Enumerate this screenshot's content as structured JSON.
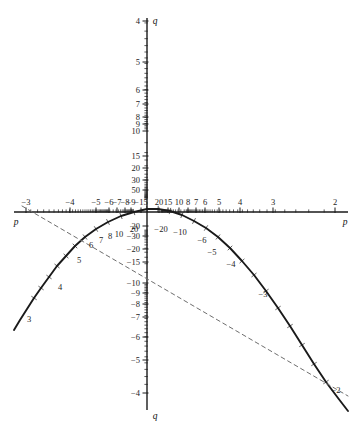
{
  "figure": {
    "background": "#ffffff",
    "axis_color": "#1a1a1a",
    "curve_color": "#1a1a1a",
    "dashed_color": "#6e6e6e"
  },
  "axes": {
    "horizontal_name_left": "p",
    "horizontal_name_right": "p",
    "vertical_name_top": "q",
    "vertical_name_bottom": "q"
  },
  "chart_data": {
    "type": "line",
    "title": "",
    "xlabel": "p",
    "ylabel": "q",
    "grid": false,
    "legend": null,
    "note": "Nomogram-style plot on reciprocal (1/value) axes. Axis tick labels are values, not linear positions.",
    "axis_ranges": {
      "p_axis_px": [
        14,
        348
      ],
      "q_axis_px": [
        18,
        410
      ],
      "origin_px": [
        147,
        212
      ]
    },
    "x_ticks_left": [
      {
        "label": "−3",
        "x": 26
      },
      {
        "label": "−4",
        "x": 70
      },
      {
        "label": "−5",
        "x": 96
      },
      {
        "label": "−6",
        "x": 109
      },
      {
        "label": "−7",
        "x": 117
      },
      {
        "label": "−8",
        "x": 125
      },
      {
        "label": "−9",
        "x": 131
      },
      {
        "label": "−15",
        "x": 141
      }
    ],
    "x_ticks_right": [
      {
        "label": "20",
        "x": 159
      },
      {
        "label": "15",
        "x": 168
      },
      {
        "label": "10",
        "x": 179
      },
      {
        "label": "8",
        "x": 188
      },
      {
        "label": "7",
        "x": 196
      },
      {
        "label": "6",
        "x": 205
      },
      {
        "label": "5",
        "x": 219
      },
      {
        "label": "4",
        "x": 240
      },
      {
        "label": "3",
        "x": 273
      },
      {
        "label": "2",
        "x": 335
      }
    ],
    "y_ticks_top": [
      {
        "label": "4",
        "y": 21
      },
      {
        "label": "5",
        "y": 62
      },
      {
        "label": "6",
        "y": 90
      },
      {
        "label": "7",
        "y": 104
      },
      {
        "label": "8",
        "y": 117
      },
      {
        "label": "9",
        "y": 124
      },
      {
        "label": "10",
        "y": 131
      },
      {
        "label": "15",
        "y": 156
      },
      {
        "label": "20",
        "y": 168
      },
      {
        "label": "30",
        "y": 180
      },
      {
        "label": "50",
        "y": 190
      }
    ],
    "y_ticks_bottom": [
      {
        "label": "20",
        "y": 226
      },
      {
        "label": "−30",
        "y": 236
      },
      {
        "label": "−20",
        "y": 249
      },
      {
        "label": "−15",
        "y": 262
      },
      {
        "label": "−10",
        "y": 283
      },
      {
        "label": "−9",
        "y": 293
      },
      {
        "label": "−8",
        "y": 304
      },
      {
        "label": "−7",
        "y": 317
      },
      {
        "label": "−6",
        "y": 337
      },
      {
        "label": "−5",
        "y": 360
      },
      {
        "label": "−4",
        "y": 393
      }
    ],
    "curve_labels": [
      {
        "label": "3",
        "x": 29,
        "y": 322
      },
      {
        "label": "4",
        "x": 60,
        "y": 290
      },
      {
        "label": "5",
        "x": 79,
        "y": 263
      },
      {
        "label": "6",
        "x": 91,
        "y": 248
      },
      {
        "label": "7",
        "x": 101,
        "y": 243
      },
      {
        "label": "8",
        "x": 110,
        "y": 239
      },
      {
        "label": "10",
        "x": 119,
        "y": 237
      },
      {
        "label": "20",
        "x": 134,
        "y": 232
      },
      {
        "label": "−20",
        "x": 161,
        "y": 232
      },
      {
        "label": "−10",
        "x": 180,
        "y": 235
      },
      {
        "label": "−6",
        "x": 202,
        "y": 243
      },
      {
        "label": "−5",
        "x": 212,
        "y": 255
      },
      {
        "label": "−4",
        "x": 231,
        "y": 267
      },
      {
        "label": "−3",
        "x": 263,
        "y": 297
      },
      {
        "label": "−2",
        "x": 336,
        "y": 393
      }
    ],
    "series": [
      {
        "name": "parabolic-curve",
        "style": "solid",
        "points_px": [
          [
            14,
            330
          ],
          [
            20,
            320
          ],
          [
            27,
            309
          ],
          [
            34,
            298
          ],
          [
            41,
            288
          ],
          [
            49,
            277
          ],
          [
            57,
            266
          ],
          [
            66,
            256
          ],
          [
            75,
            246
          ],
          [
            85,
            237
          ],
          [
            96,
            229
          ],
          [
            108,
            222
          ],
          [
            121,
            216
          ],
          [
            134,
            212
          ],
          [
            147,
            209
          ],
          [
            158,
            209
          ],
          [
            170,
            211
          ],
          [
            182,
            215
          ],
          [
            194,
            221
          ],
          [
            206,
            228
          ],
          [
            218,
            237
          ],
          [
            230,
            248
          ],
          [
            242,
            261
          ],
          [
            254,
            275
          ],
          [
            266,
            291
          ],
          [
            278,
            308
          ],
          [
            290,
            326
          ],
          [
            302,
            345
          ],
          [
            314,
            364
          ],
          [
            326,
            382
          ],
          [
            338,
            398
          ],
          [
            348,
            411
          ]
        ]
      },
      {
        "name": "dashed-line",
        "style": "dashed",
        "points_px": [
          [
            22,
            206
          ],
          [
            348,
            396
          ]
        ]
      }
    ]
  }
}
